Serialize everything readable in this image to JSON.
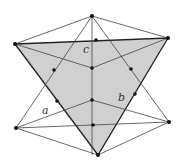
{
  "diagram": {
    "type": "geometry-figure",
    "colors": {
      "shade": "#d0d0d0",
      "line": "#444444",
      "thick_line": "#222222",
      "point": "#111111"
    },
    "labels": {
      "a": "a",
      "b": "b",
      "c": "c"
    },
    "points": {
      "T": [
        92,
        16
      ],
      "L": [
        15,
        44
      ],
      "R": [
        168,
        38
      ],
      "B": [
        98,
        155
      ],
      "LL": [
        16,
        128
      ],
      "LR": [
        169,
        122
      ],
      "Mc": [
        92,
        68
      ],
      "Mb": [
        92,
        100
      ],
      "TopMid": [
        96,
        40
      ],
      "BotMid": [
        93,
        125
      ],
      "LeftA": [
        54,
        70
      ],
      "LeftB": [
        57,
        101
      ],
      "RightA": [
        131,
        69
      ],
      "RightB": [
        135,
        94
      ]
    }
  }
}
